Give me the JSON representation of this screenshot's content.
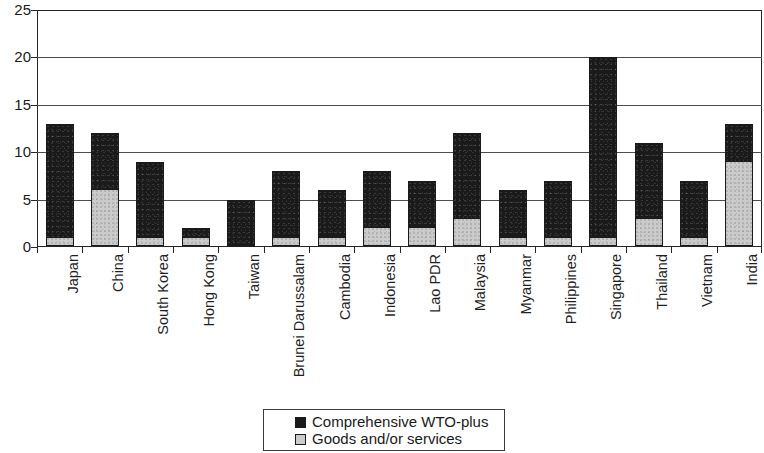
{
  "chart_data": {
    "type": "bar",
    "stacked": true,
    "title": "",
    "subtitle": "",
    "xlabel": "",
    "ylabel": "",
    "ylim": [
      0,
      25
    ],
    "yticks": [
      0,
      5,
      10,
      15,
      20,
      25
    ],
    "grid": true,
    "legend_position": "bottom",
    "categories": [
      "Japan",
      "China",
      "South Korea",
      "Hong Kong",
      "Taiwan",
      "Brunei Darussalam",
      "Cambodia",
      "Indonesia",
      "Lao PDR",
      "Malaysia",
      "Myanmar",
      "Philippines",
      "Singapore",
      "Thailand",
      "Vietnam",
      "India"
    ],
    "series": [
      {
        "name": "Goods and/or services",
        "color": "#cbcbcb",
        "values": [
          1,
          6,
          1,
          1,
          0,
          1,
          1,
          2,
          2,
          3,
          1,
          1,
          1,
          3,
          1,
          9
        ]
      },
      {
        "name": "Comprehensive WTO-plus",
        "color": "#1a1a1a",
        "values": [
          12,
          6,
          8,
          1,
          5,
          7,
          5,
          6,
          5,
          9,
          5,
          6,
          19,
          8,
          6,
          4
        ]
      }
    ],
    "totals": [
      13,
      12,
      9,
      2,
      5,
      8,
      6,
      8,
      7,
      12,
      6,
      7,
      20,
      11,
      7,
      13
    ]
  },
  "legend": {
    "items": [
      {
        "label": "Comprehensive WTO-plus",
        "swatch": "black"
      },
      {
        "label": "Goods and/or services",
        "swatch": "grey"
      }
    ]
  },
  "axis": {
    "y_tick_labels": [
      "25",
      "20",
      "15",
      "10",
      "5",
      "0"
    ]
  }
}
